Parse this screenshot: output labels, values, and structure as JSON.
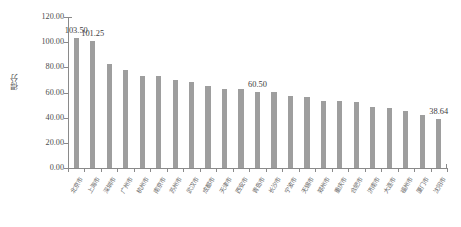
{
  "chart_data": {
    "type": "bar",
    "title": "",
    "subtitle": "",
    "xlabel": "",
    "ylabel": "得分",
    "ylim": [
      0,
      120
    ],
    "ytick_step": 20,
    "grid": false,
    "legend": "none",
    "bar_color": "#9e9e9e",
    "axis_color": "#8a8a8a",
    "ytick_labels": [
      "120.00",
      "100.00",
      "80.00",
      "60.00",
      "40.00",
      "20.00",
      "0.00"
    ],
    "ytick_values": [
      120,
      100,
      80,
      60,
      40,
      20,
      0
    ],
    "categories": [
      "北京市",
      "上海市",
      "深圳市",
      "广州市",
      "杭州市",
      "南京市",
      "苏州市",
      "武汉市",
      "成都市",
      "天津市",
      "西安市",
      "青岛市",
      "长沙市",
      "宁波市",
      "无锡市",
      "郑州市",
      "重庆市",
      "合肥市",
      "济南市",
      "大连市",
      "福州市",
      "厦门市",
      "沈阳市"
    ],
    "values": [
      103.5,
      101.25,
      82.8,
      78.2,
      73.5,
      73.4,
      70.2,
      68.3,
      65.4,
      62.6,
      62.5,
      60.5,
      60.2,
      57.2,
      56.6,
      53.2,
      52.9,
      52.4,
      48.6,
      47.8,
      45.2,
      41.8,
      38.64
    ],
    "labeled_points": [
      {
        "index": 0,
        "value": 103.5,
        "text": "103.50"
      },
      {
        "index": 1,
        "value": 101.25,
        "text": "101.25"
      },
      {
        "index": 11,
        "value": 60.5,
        "text": "60.50"
      },
      {
        "index": 22,
        "value": 38.64,
        "text": "38.64"
      }
    ]
  }
}
